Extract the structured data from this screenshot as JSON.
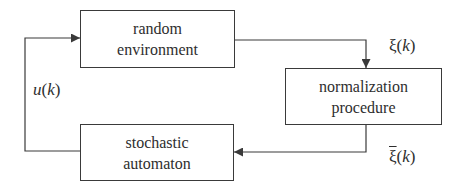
{
  "blocks": {
    "environment": {
      "line1": "random",
      "line2": "environment"
    },
    "normalization": {
      "line1": "normalization",
      "line2": "procedure"
    },
    "automaton": {
      "line1": "stochastic",
      "line2": "automaton"
    }
  },
  "signals": {
    "xi": {
      "symbol": "ξ",
      "arg": "k"
    },
    "xi_bar": {
      "symbol": "ξ",
      "arg": "k"
    },
    "u": {
      "symbol": "u",
      "arg": "k"
    }
  },
  "colors": {
    "line": "#3a3a3a",
    "text": "#2e2e2e",
    "background": "#ffffff"
  }
}
